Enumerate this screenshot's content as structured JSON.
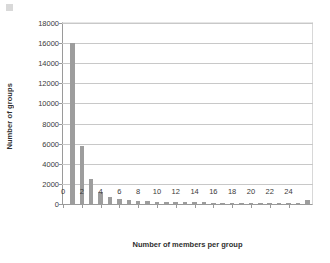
{
  "chart_data": {
    "type": "bar",
    "title": "",
    "xlabel": "Number of members per group",
    "ylabel": "Number of groups",
    "categories": [
      1,
      2,
      3,
      4,
      5,
      6,
      7,
      8,
      9,
      10,
      11,
      12,
      13,
      14,
      15,
      16,
      17,
      18,
      19,
      20,
      21,
      22,
      23,
      24,
      25,
      26
    ],
    "values": [
      16000,
      5800,
      2450,
      1200,
      700,
      500,
      420,
      330,
      290,
      250,
      230,
      200,
      190,
      170,
      160,
      150,
      140,
      130,
      120,
      115,
      110,
      100,
      95,
      90,
      85,
      380
    ],
    "series": [
      {
        "name": "Number of groups",
        "values": [
          16000,
          5800,
          2450,
          1200,
          700,
          500,
          420,
          330,
          290,
          250,
          230,
          200,
          190,
          170,
          160,
          150,
          140,
          130,
          120,
          115,
          110,
          100,
          95,
          90,
          85,
          380
        ]
      }
    ],
    "ylim": [
      0,
      18000
    ],
    "ytick_values": [
      0,
      2000,
      4000,
      6000,
      8000,
      10000,
      12000,
      14000,
      16000,
      18000
    ],
    "ytick_labels": [
      "0",
      "2000",
      "4000",
      "6000",
      "8000",
      "10000",
      "12000",
      "14000",
      "16000",
      "18000"
    ],
    "xlim": [
      0,
      26.5
    ],
    "xtick_values": [
      0,
      2,
      4,
      6,
      8,
      10,
      12,
      14,
      16,
      18,
      20,
      22,
      24
    ],
    "xtick_labels": [
      "0",
      "2",
      "4",
      "6",
      "8",
      "10",
      "12",
      "14",
      "16",
      "18",
      "20",
      "22",
      "24"
    ],
    "grid": "horizontal",
    "legend": "none",
    "bar_color": "#9d9d9d",
    "gridline_color": "#c8c8c8",
    "axis_color": "#9a9a9a",
    "background_color": "#ffffff"
  }
}
